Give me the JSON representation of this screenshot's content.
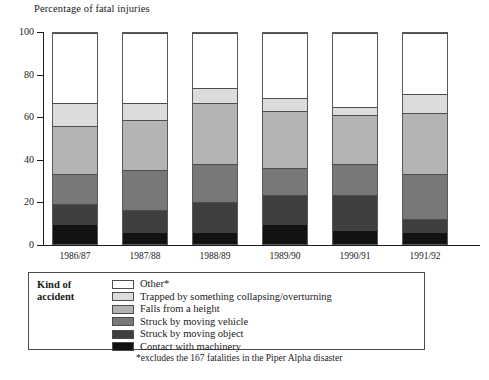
{
  "chart_data": {
    "type": "bar",
    "subtype": "stacked-percentage-column",
    "title": "Percentage of fatal injuries",
    "xlabel": "",
    "ylabel": "",
    "ylim": [
      0,
      100
    ],
    "yticks": [
      0,
      20,
      40,
      60,
      80,
      100
    ],
    "grid": false,
    "legend_position": "bottom",
    "legend_title": "Kind of accident",
    "categories": [
      "1986/87",
      "1987/88",
      "1988/89",
      "1989/90",
      "1990/91",
      "1991/92"
    ],
    "series": [
      {
        "name": "Contact with machinery",
        "color": "#121212",
        "values": [
          9,
          5,
          5,
          9,
          6,
          5
        ]
      },
      {
        "name": "Struck by moving object",
        "color": "#3f3f3f",
        "values": [
          10,
          11,
          15,
          14,
          17,
          7
        ]
      },
      {
        "name": "Struck by moving vehicle",
        "color": "#787878",
        "values": [
          14,
          19,
          18,
          13,
          15,
          21
        ]
      },
      {
        "name": "Falls from a height",
        "color": "#b4b4b4",
        "values": [
          23,
          24,
          29,
          27,
          23,
          29
        ]
      },
      {
        "name": "Trapped by something collapsing/overturning",
        "color": "#dcdcdc",
        "values": [
          11,
          8,
          7,
          6,
          4,
          9
        ]
      },
      {
        "name": "Other*",
        "color": "#ffffff",
        "values": [
          33,
          33,
          26,
          31,
          35,
          29
        ]
      }
    ],
    "cumulative_tops": {
      "1986/87": [
        9,
        19,
        33,
        56,
        67,
        100
      ],
      "1987/88": [
        5,
        16,
        35,
        59,
        67,
        100
      ],
      "1988/89": [
        5,
        20,
        38,
        67,
        74,
        100
      ],
      "1989/90": [
        9,
        23,
        36,
        63,
        69,
        100
      ],
      "1990/91": [
        6,
        23,
        38,
        61,
        65,
        100
      ],
      "1991/92": [
        5,
        12,
        33,
        62,
        71,
        100
      ]
    },
    "footnote": "*excludes the 167 fatalities in the Piper Alpha disaster"
  },
  "legend": {
    "title_line1": "Kind of",
    "title_line2": "accident",
    "entries": [
      {
        "label": "Other*",
        "color": "#ffffff"
      },
      {
        "label": "Trapped by something collapsing/overturning",
        "color": "#dcdcdc"
      },
      {
        "label": "Falls from a height",
        "color": "#b4b4b4"
      },
      {
        "label": "Struck by moving vehicle",
        "color": "#787878"
      },
      {
        "label": "Struck by moving object",
        "color": "#3f3f3f"
      },
      {
        "label": "Contact with machinery",
        "color": "#121212"
      }
    ]
  }
}
